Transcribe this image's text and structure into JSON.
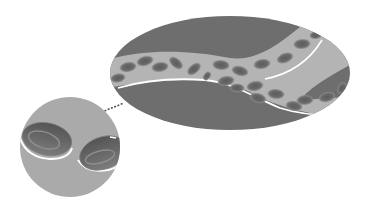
{
  "illustration": {
    "subject": "blood vessel with red blood cells, magnified inset",
    "colors": {
      "background": "#ffffff",
      "tissue": "#6e6e6e",
      "vessel_lumen": "#b4b4b4",
      "vessel_wall": "#ffffff",
      "cell_fill": "#707070",
      "cell_center": "#5a5a5a",
      "cell_rim": "#8a8a8a",
      "inset_bg": "#aaaaaa",
      "connector": "#555555"
    },
    "vessel_view": {
      "shape": "ellipse",
      "cx": 230,
      "cy": 73,
      "rx": 120,
      "ry": 57
    },
    "inset_view": {
      "shape": "circle",
      "cx": 70,
      "cy": 147,
      "r": 50
    }
  }
}
